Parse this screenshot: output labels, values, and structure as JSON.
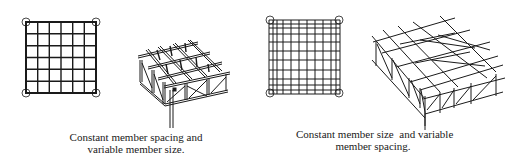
{
  "figures": [
    {
      "id": "constant-spacing",
      "plan": {
        "type": "grid-plan",
        "cells_x": 6,
        "cells_y": 6,
        "column_supports": 4
      },
      "caption": {
        "line1": "Constant member spacing and",
        "line2": "variable member size."
      }
    },
    {
      "id": "constant-size",
      "plan": {
        "type": "grid-plan",
        "spacing": "variable (denser toward edges)",
        "lines_x": 12,
        "lines_y": 12,
        "column_supports": 4
      },
      "caption": {
        "line1": "Constant member size  and variable",
        "line2": "member spacing."
      }
    }
  ],
  "colors": {
    "line": "#1a1a1a",
    "background": "#ffffff"
  }
}
